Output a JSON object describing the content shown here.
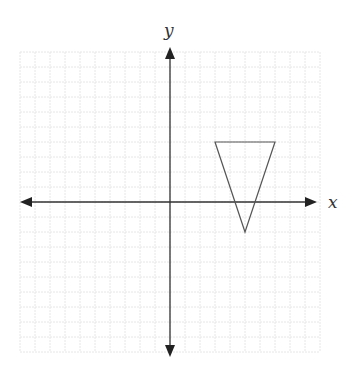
{
  "diagram": {
    "type": "coordinate-plane",
    "axes": {
      "x_label": "x",
      "y_label": "y",
      "x_range": [
        -10,
        10
      ],
      "y_range": [
        -10,
        10
      ],
      "grid": true,
      "grid_spacing_units": 1,
      "tick_labels": false
    },
    "shapes": [
      {
        "name": "triangle",
        "type": "polygon",
        "vertices": [
          [
            3,
            4
          ],
          [
            7,
            4
          ],
          [
            5,
            -2
          ]
        ],
        "stroke": "#555555",
        "fill": "none"
      }
    ],
    "colors": {
      "axis": "#333333",
      "grid": "#e6e6e6",
      "shape_stroke": "#555555",
      "background": "#ffffff"
    }
  }
}
